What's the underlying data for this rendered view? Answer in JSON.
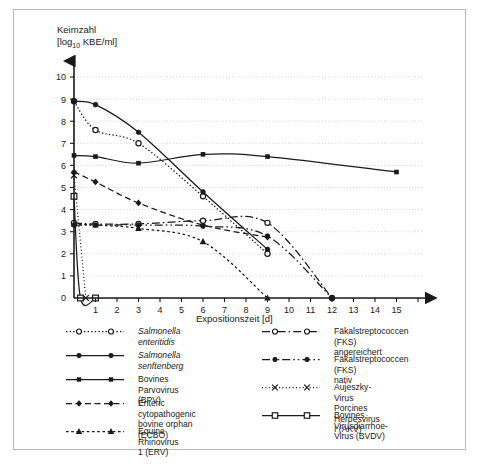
{
  "axes": {
    "y_title_line1": "Keimzahl",
    "y_title_line2_pre": "[log",
    "y_title_sub": "10",
    "y_title_line2_post": " KBE/ml]",
    "x_title": "Expositionszeit [d]"
  },
  "legend": {
    "left": [
      {
        "label": "Salmonella enteritidis",
        "italic": true,
        "style": "dotted",
        "marker": "open-circle"
      },
      {
        "label": "Salmonella senftenberg",
        "italic": true,
        "style": "solid",
        "marker": "filled-circle"
      },
      {
        "label": "Bovines Parvovirus (BPV)",
        "italic": false,
        "style": "solid",
        "marker": "filled-square"
      },
      {
        "label": "Enteric cytopathogenic\nbovine orphan (ECBO)",
        "italic": false,
        "style": "dashed",
        "marker": "filled-diamond"
      },
      {
        "label": "Equine Rhinovirus 1 (ERV)",
        "italic": false,
        "style": "fine-dashed",
        "marker": "filled-triangle"
      }
    ],
    "right": [
      {
        "label": "Fäkalstreptococcen (FKS)\nangereichert",
        "italic": false,
        "style": "dash-dot",
        "marker": "open-circle"
      },
      {
        "label": "Fäkalstreptococcen (FKS)\nnativ",
        "italic": false,
        "style": "dash-dot-dot",
        "marker": "filled-circle"
      },
      {
        "label": "Aujeszky-Virus\nPorcines Herpesvirus I (AKV)",
        "italic": false,
        "style": "fine-dotted",
        "marker": "cross"
      },
      {
        "label": "Bovines Virusdiarrhoe-\nVirus (BVDV)",
        "italic": false,
        "style": "solid",
        "marker": "open-square"
      }
    ]
  },
  "chart_data": {
    "type": "line",
    "title": "",
    "xlabel": "Expositionszeit [d]",
    "ylabel": "Keimzahl [log10 KBE/ml]",
    "xlim": [
      0,
      16
    ],
    "ylim": [
      0,
      10
    ],
    "xticks": [
      0,
      1,
      2,
      3,
      4,
      5,
      6,
      7,
      8,
      9,
      10,
      11,
      12,
      13,
      14,
      15,
      16
    ],
    "yticks": [
      0,
      1,
      2,
      3,
      4,
      5,
      6,
      7,
      8,
      9,
      10
    ],
    "grid": "horizontal-dotted",
    "legend_position": "below-plot-two-columns",
    "series": [
      {
        "name": "Salmonella enteritidis",
        "style": "dotted",
        "marker": "open-circle",
        "x": [
          0,
          1,
          3,
          6,
          9
        ],
        "y": [
          8.9,
          7.6,
          7.0,
          4.6,
          2.0
        ]
      },
      {
        "name": "Salmonella senftenberg",
        "style": "solid",
        "marker": "filled-circle",
        "x": [
          0,
          1,
          3,
          6,
          9
        ],
        "y": [
          8.9,
          8.75,
          7.5,
          4.8,
          2.2
        ]
      },
      {
        "name": "Bovines Parvovirus (BPV)",
        "style": "solid",
        "marker": "filled-square",
        "x": [
          0,
          1,
          3,
          6,
          9,
          15
        ],
        "y": [
          6.45,
          6.4,
          6.1,
          6.5,
          6.4,
          5.7
        ]
      },
      {
        "name": "Enteric cytopathogenic bovine orphan (ECBO)",
        "style": "dashed",
        "marker": "filled-diamond",
        "x": [
          0,
          1,
          3,
          6,
          9
        ],
        "y": [
          5.7,
          5.25,
          4.3,
          3.3,
          2.75
        ]
      },
      {
        "name": "Equine Rhinovirus 1 (ERV)",
        "style": "fine-dashed",
        "marker": "filled-triangle",
        "x": [
          0,
          1,
          3,
          6,
          9
        ],
        "y": [
          3.35,
          3.3,
          3.15,
          2.55,
          0.0
        ]
      },
      {
        "name": "Fäkalstreptococcen (FKS) angereichert",
        "style": "dash-dot",
        "marker": "open-circle",
        "x": [
          0,
          1,
          3,
          6,
          9,
          12
        ],
        "y": [
          3.4,
          3.35,
          3.35,
          3.5,
          3.4,
          0.0
        ]
      },
      {
        "name": "Fäkalstreptococcen (FKS) nativ",
        "style": "dash-dot-dot",
        "marker": "filled-circle",
        "x": [
          0,
          1,
          3,
          6,
          9,
          12
        ],
        "y": [
          3.3,
          3.3,
          3.3,
          3.25,
          2.8,
          0.0
        ]
      },
      {
        "name": "Aujeszky-Virus / Porcines Herpesvirus I (AKV)",
        "style": "fine-dotted",
        "marker": "cross",
        "x": [
          0,
          0.55
        ],
        "y": [
          5.55,
          0.0
        ]
      },
      {
        "name": "Bovines Virusdiarrhoe-Virus (BVDV)",
        "style": "solid",
        "marker": "open-square",
        "x": [
          0,
          0.3,
          1.0
        ],
        "y": [
          4.6,
          0.0,
          0.0
        ]
      }
    ]
  }
}
